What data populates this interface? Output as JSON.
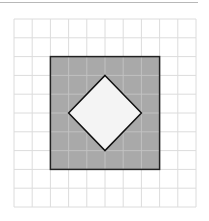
{
  "figure": {
    "grid": {
      "columns": 10,
      "rows": 10,
      "line_color": "#dcdcdc"
    },
    "outer_square": {
      "fill": "#a9a9a9",
      "stroke": "#222222",
      "grid_span": [
        2,
        2,
        8,
        8
      ]
    },
    "inner_diamond": {
      "fill": "#f4f4f4",
      "stroke": "#111111",
      "vertices_grid": [
        [
          5,
          3
        ],
        [
          7,
          5
        ],
        [
          5,
          7
        ],
        [
          3,
          5
        ]
      ]
    },
    "colors": {
      "shaded": "#a9a9a9",
      "background": "#ffffff",
      "outline": "#222222"
    }
  }
}
